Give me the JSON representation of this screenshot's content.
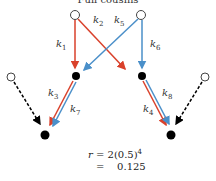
{
  "title": "Full cousins",
  "labels": {
    "k1": "k",
    "k1_sub": "1",
    "k2": "k",
    "k2_sub": "2",
    "k3": "k",
    "k3_sub": "3",
    "k4": "k",
    "k4_sub": "4",
    "k5": "k",
    "k5_sub": "5",
    "k6": "k",
    "k6_sub": "6",
    "k7": "k",
    "k7_sub": "7",
    "k8": "k",
    "k8_sub": "8"
  },
  "formula": {
    "line1_var": "r",
    "line1_rest": " = 2(0.5)",
    "line1_exp": "4",
    "line2": "=    0.125"
  },
  "colors": {
    "red": "#d9412b",
    "blue": "#4a8fc9",
    "node": "#000000"
  }
}
